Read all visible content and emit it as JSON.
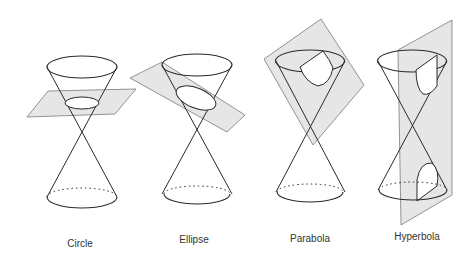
{
  "colors": {
    "stroke": "#2a2a2a",
    "plane_fill": "#e6e6e6",
    "plane_stroke": "#7a7a7a",
    "background": "#ffffff"
  },
  "panels": [
    {
      "id": "circle",
      "label": "Circle",
      "label_x": 80,
      "label_y": 238
    },
    {
      "id": "ellipse",
      "label": "Ellipse",
      "label_x": 194,
      "label_y": 234
    },
    {
      "id": "parabola",
      "label": "Parabola",
      "label_x": 310,
      "label_y": 233
    },
    {
      "id": "hyperbola",
      "label": "Hyperbola",
      "label_x": 417,
      "label_y": 231
    }
  ]
}
